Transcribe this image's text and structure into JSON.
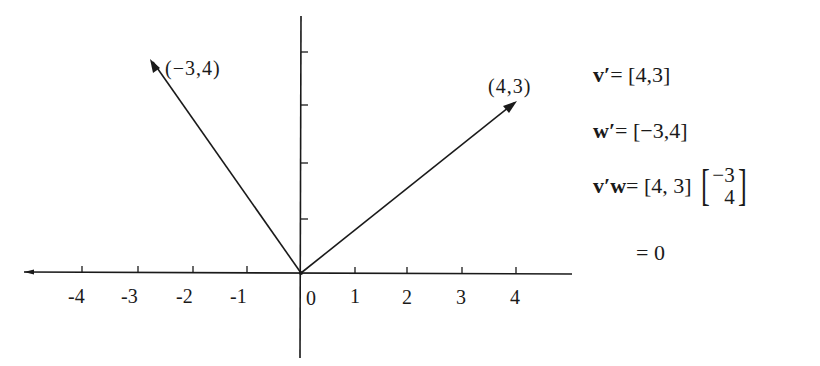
{
  "diagram": {
    "type": "vector-plot",
    "x_axis": {
      "tick_labels": [
        "-4",
        "-3",
        "-2",
        "-1",
        "0",
        "1",
        "2",
        "3",
        "4"
      ]
    },
    "y_axis": {
      "ticks": 4
    },
    "vectors": [
      {
        "name": "v",
        "x": 4,
        "y": 3,
        "label": "(4,3)"
      },
      {
        "name": "w",
        "x": -3,
        "y": 4,
        "label": "(−3,4)"
      }
    ]
  },
  "equations": {
    "line1": {
      "lhs": "v′",
      "rhs": "= [4,3]"
    },
    "line2": {
      "lhs": "w′",
      "rhs": "= [−3,4]"
    },
    "line3": {
      "lhs": "v′w",
      "rhs": "= [4,  3]",
      "col_top": "−3",
      "col_bottom": "4"
    },
    "line4": {
      "rhs": "= 0"
    }
  }
}
